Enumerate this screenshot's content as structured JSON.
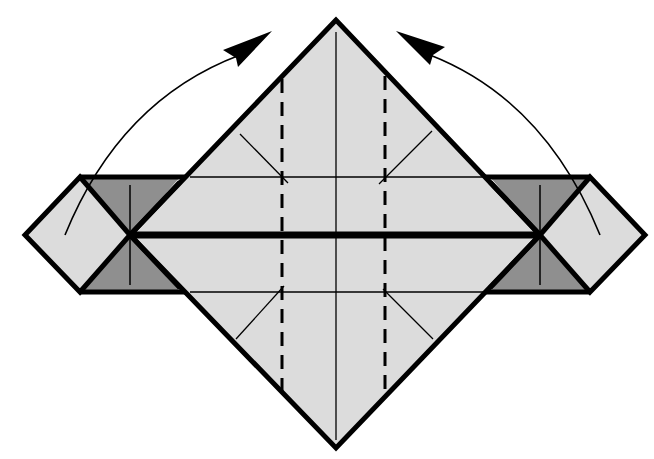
{
  "diagram": {
    "type": "origami-fold-step",
    "colors": {
      "paper_light": "#dcdcdc",
      "paper_dark": "#8f8f8f",
      "outline": "#000000",
      "background": "#ffffff"
    },
    "elements": {
      "main_diamond": {
        "top": [
          336,
          20
        ],
        "left": [
          130,
          235
        ],
        "right": [
          540,
          235
        ],
        "bottom": [
          336,
          448
        ]
      },
      "band": {
        "x1": 80,
        "x2": 590,
        "y_top": 177,
        "y_bottom": 292
      },
      "left_flap": {
        "points": [
          [
            25,
            235
          ],
          [
            80,
            177
          ],
          [
            130,
            235
          ],
          [
            80,
            292
          ]
        ]
      },
      "right_flap": {
        "points": [
          [
            540,
            235
          ],
          [
            590,
            177
          ],
          [
            645,
            235
          ],
          [
            590,
            292
          ]
        ]
      },
      "valley_fold_lines": [
        {
          "x": 282,
          "y1": 79,
          "y2": 393
        },
        {
          "x": 385,
          "y1": 76,
          "y2": 396
        }
      ],
      "center_crease": {
        "x": 336,
        "y1": 32,
        "y2": 440
      },
      "horizontal_thick_line": {
        "y": 235,
        "x1": 130,
        "x2": 540
      },
      "arrows": [
        {
          "name": "left-fold-arrow",
          "direction": "up-right"
        },
        {
          "name": "right-fold-arrow",
          "direction": "up-left"
        }
      ]
    }
  }
}
